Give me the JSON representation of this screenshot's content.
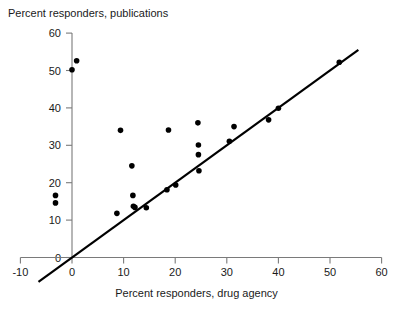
{
  "chart_data": {
    "type": "scatter",
    "title": "",
    "xlabel": "Percent responders, drug agency",
    "ylabel": "Percent responders, publications",
    "xlim": [
      -10,
      60
    ],
    "ylim": [
      0,
      60
    ],
    "xticks": [
      -10,
      0,
      10,
      20,
      30,
      40,
      50,
      60
    ],
    "xtick_labels": [
      "-10",
      "0",
      "10",
      "20",
      "30",
      "40",
      "50",
      "60"
    ],
    "yticks": [
      0,
      10,
      20,
      30,
      40,
      50,
      60
    ],
    "ytick_labels": [
      "0",
      "10",
      "20",
      "30",
      "40",
      "50",
      "60"
    ],
    "grid": false,
    "legend": null,
    "marker": {
      "shape": "circle",
      "color": "#000000",
      "size_px": 5.6
    },
    "reference_line": {
      "name": "identity-line",
      "description": "y = x line of equality",
      "slope": 1,
      "intercept": 0,
      "x_start": -6.5,
      "x_end": 55.5,
      "color": "#000000",
      "width_px": 2.2
    },
    "points": [
      {
        "x": -3.2,
        "y": 16.6
      },
      {
        "x": -3.2,
        "y": 14.6
      },
      {
        "x": 0.0,
        "y": 50.2
      },
      {
        "x": 0.9,
        "y": 52.6
      },
      {
        "x": 8.7,
        "y": 11.8
      },
      {
        "x": 9.4,
        "y": 34.0
      },
      {
        "x": 11.6,
        "y": 24.5
      },
      {
        "x": 11.8,
        "y": 16.6
      },
      {
        "x": 11.9,
        "y": 13.7
      },
      {
        "x": 12.2,
        "y": 13.4
      },
      {
        "x": 14.4,
        "y": 13.3
      },
      {
        "x": 18.4,
        "y": 18.1
      },
      {
        "x": 18.7,
        "y": 34.1
      },
      {
        "x": 20.1,
        "y": 19.4
      },
      {
        "x": 24.4,
        "y": 36.0
      },
      {
        "x": 24.5,
        "y": 30.1
      },
      {
        "x": 24.5,
        "y": 27.5
      },
      {
        "x": 24.6,
        "y": 23.2
      },
      {
        "x": 30.5,
        "y": 31.1
      },
      {
        "x": 31.4,
        "y": 35.0
      },
      {
        "x": 38.1,
        "y": 36.8
      },
      {
        "x": 40.0,
        "y": 39.9
      },
      {
        "x": 51.8,
        "y": 52.2
      }
    ]
  },
  "axes": {
    "x_axis_name": "x-axis",
    "y_axis_name": "y-axis"
  }
}
